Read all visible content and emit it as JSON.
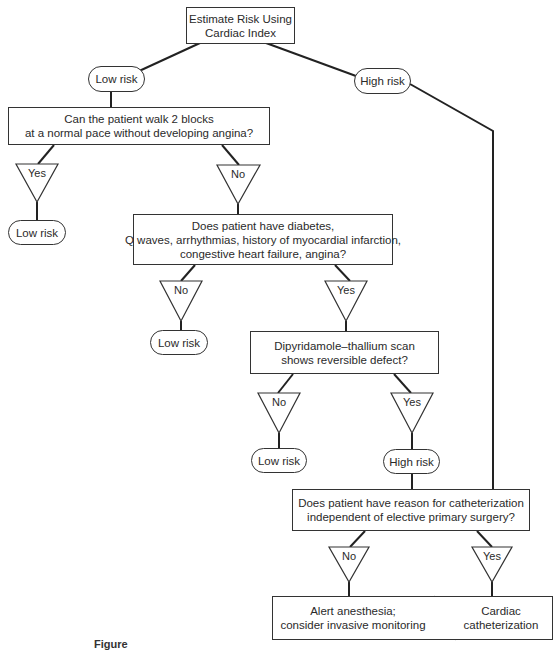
{
  "start": {
    "lines": [
      "Estimate Risk Using",
      "Cardiac Index"
    ]
  },
  "top_branches": {
    "low": "Low risk",
    "high": "High risk"
  },
  "q1": {
    "lines": [
      "Can the patient walk 2 blocks",
      "at a normal pace without developing angina?"
    ],
    "yes": "Yes",
    "no": "No",
    "yes_outcome": "Low risk"
  },
  "q2": {
    "lines": [
      "Does patient have diabetes,",
      "Q waves, arrhythmias, history of myocardial infarction,",
      "congestive heart failure, angina?"
    ],
    "no": "No",
    "yes": "Yes",
    "no_outcome": "Low risk"
  },
  "q3": {
    "lines": [
      "Dipyridamole–thallium scan",
      "shows reversible defect?"
    ],
    "no": "No",
    "yes": "Yes",
    "no_outcome": "Low risk",
    "yes_outcome": "High risk"
  },
  "q4": {
    "lines": [
      "Does patient have reason for catheterization",
      "independent of elective primary surgery?"
    ],
    "no": "No",
    "yes": "Yes"
  },
  "final": {
    "no_outcome": [
      "Alert anesthesia;",
      "consider invasive monitoring"
    ],
    "yes_outcome": [
      "Cardiac",
      "catheterization"
    ]
  },
  "caption": "Figure",
  "colors": {
    "stroke": "#222222",
    "text": "#2a2a2a",
    "background": "#ffffff"
  }
}
